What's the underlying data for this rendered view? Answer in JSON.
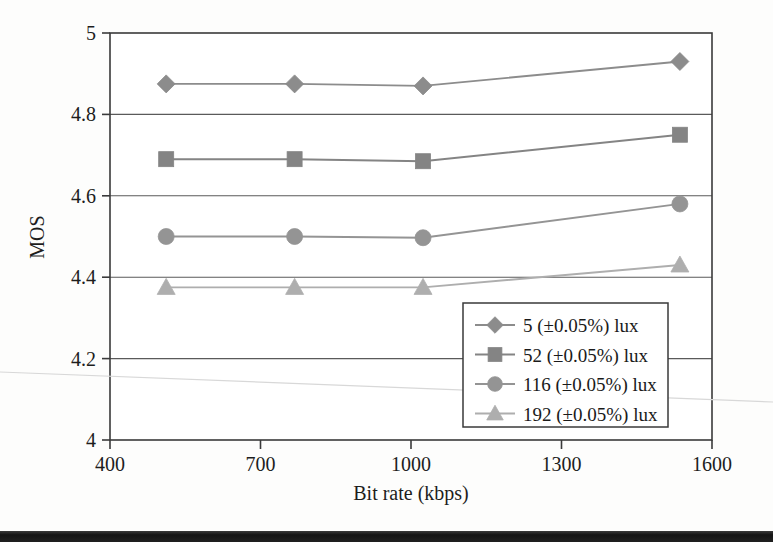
{
  "chart_data": {
    "type": "line",
    "title": "",
    "xlabel": "Bit rate (kbps)",
    "ylabel": "MOS",
    "xlim": [
      400,
      1600
    ],
    "ylim": [
      4,
      5
    ],
    "xticks": [
      400,
      700,
      1000,
      1300,
      1600
    ],
    "xtick_labels": [
      "400",
      "700",
      "1000",
      "1300",
      "1600"
    ],
    "yticks": [
      4,
      4.2,
      4.4,
      4.6,
      4.8,
      5
    ],
    "ytick_labels": [
      "4",
      "4.2",
      "4.4",
      "4.6",
      "4.8",
      "5"
    ],
    "grid": "horizontal",
    "legend_position": "lower-right-inside",
    "x": [
      512,
      768,
      1024,
      1536
    ],
    "series": [
      {
        "name": "5 (±0.05%) lux",
        "marker": "diamond",
        "color": "#8c8c8c",
        "values": [
          4.875,
          4.875,
          4.87,
          4.93
        ]
      },
      {
        "name": "52 (±0.05%) lux",
        "marker": "square",
        "color": "#848484",
        "values": [
          4.69,
          4.69,
          4.685,
          4.75
        ]
      },
      {
        "name": "116 (±0.05%) lux",
        "marker": "circle",
        "color": "#949494",
        "values": [
          4.5,
          4.5,
          4.497,
          4.58
        ]
      },
      {
        "name": "192 (±0.05%) lux",
        "marker": "triangle",
        "color": "#aeaeae",
        "values": [
          4.375,
          4.375,
          4.375,
          4.43
        ]
      }
    ]
  },
  "legend": {
    "entries": [
      {
        "label": "5 (±0.05%) lux"
      },
      {
        "label": "52 (±0.05%) lux"
      },
      {
        "label": "116 (±0.05%) lux"
      },
      {
        "label": "192 (±0.05%) lux"
      }
    ]
  },
  "axes": {
    "x_title": "Bit rate (kbps)",
    "y_title": "MOS"
  }
}
